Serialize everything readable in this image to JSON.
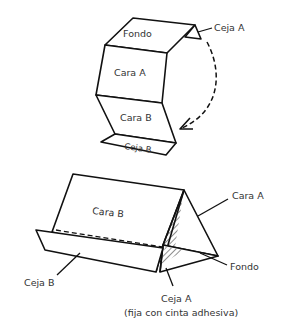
{
  "diagram": {
    "top_figure": {
      "labels": {
        "fondo": "Fondo",
        "cara_a": "Cara A",
        "cara_b": "Cara B",
        "ceja_b": "Ceja B",
        "ceja_a": "Ceja A"
      },
      "arrow": "dashed-curved-arrow"
    },
    "bottom_figure": {
      "labels": {
        "cara_b": "Cara B",
        "cara_a": "Cara A",
        "fondo": "Fondo",
        "ceja_b": "Ceja B",
        "ceja_a": "Ceja A",
        "ceja_a_note": "(fija con cinta adhesiva)"
      }
    },
    "colors": {
      "line": "#111111",
      "text": "#333333",
      "background": "#ffffff"
    }
  }
}
